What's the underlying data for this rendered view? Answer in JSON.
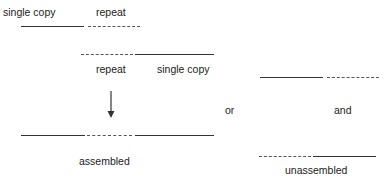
{
  "diagram": {
    "top_fragment": {
      "labels": {
        "left": "single copy",
        "right": "repeat"
      }
    },
    "second_fragment": {
      "labels": {
        "left": "repeat",
        "right": "single copy"
      }
    },
    "assembled": {
      "label": "assembled"
    },
    "connector_or": "or",
    "connector_and": "and",
    "unassembled": {
      "label": "unassembled"
    },
    "colors": {
      "line": "#333333",
      "text": "#222222",
      "background": "#ffffff"
    }
  }
}
